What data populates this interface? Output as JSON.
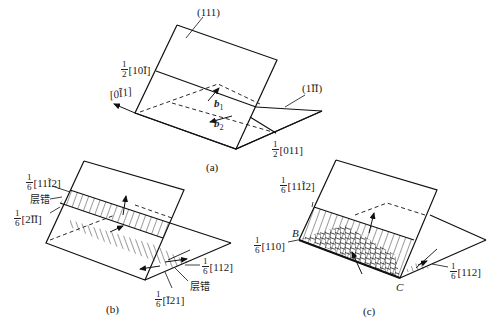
{
  "figure_a": {
    "caption": "(a)",
    "plane_labels": {
      "top": "(111)",
      "right": "(1ĪĪ)"
    },
    "vector_labels": {
      "left_upper": {
        "numerator": "1",
        "denominator": "2",
        "index": "[10Ī]"
      },
      "left_arrow": "[0Ī1]",
      "bottom_right": {
        "numerator": "1",
        "denominator": "2",
        "index": "[011]"
      }
    },
    "burgers": {
      "b1": "b",
      "b1_sub": "1",
      "b2": "b",
      "b2_sub": "2"
    }
  },
  "figure_b": {
    "caption": "(b)",
    "labels": {
      "upper": {
        "numerator": "1",
        "denominator": "6",
        "index": "[11Ĩ2]"
      },
      "fault_left": "层错",
      "lower": {
        "numerator": "1",
        "denominator": "6",
        "index": "[2ĪĪ]"
      },
      "right_112": {
        "numerator": "1",
        "denominator": "6",
        "index": "[112]"
      },
      "fault_right": "层错",
      "bottom": {
        "numerator": "1",
        "denominator": "6",
        "index": "[Ī21]"
      }
    }
  },
  "figure_c": {
    "caption": "(c)",
    "labels": {
      "upper": {
        "numerator": "1",
        "denominator": "6",
        "index": "[11Ĩ2]"
      },
      "left": {
        "numerator": "1",
        "denominator": "6",
        "index": "[110]"
      },
      "right": {
        "numerator": "1",
        "denominator": "6",
        "index": "[112]"
      },
      "point_b": "B",
      "point_c": "C"
    }
  }
}
